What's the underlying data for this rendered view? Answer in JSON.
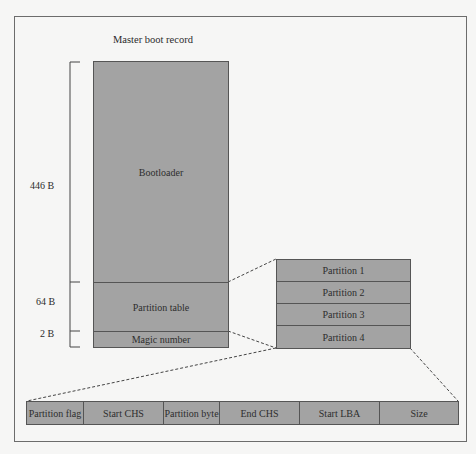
{
  "title": "Master boot record",
  "mbr": {
    "sections": [
      {
        "label": "Bootloader",
        "size": "446 B"
      },
      {
        "label": "Partition table",
        "size": "64 B"
      },
      {
        "label": "Magic number",
        "size": "2 B"
      }
    ]
  },
  "partitions": [
    "Partition 1",
    "Partition 2",
    "Partition 3",
    "Partition 4"
  ],
  "entry_fields": [
    "Partition flag",
    "Start CHS",
    "Partition byte",
    "End CHS",
    "Start LBA",
    "Size"
  ],
  "colors": {
    "box_fill": "#a3a3a3",
    "border": "#555555",
    "background": "#f6f6f5"
  }
}
